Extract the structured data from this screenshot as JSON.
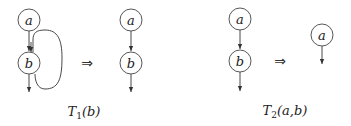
{
  "figure": {
    "transform1": {
      "label_main": "T",
      "label_sub": "1",
      "label_args": "(b)",
      "before": {
        "nodes": [
          "a",
          "b"
        ],
        "edges": [
          "a->b",
          "b->b (self loop)",
          "b->out"
        ]
      },
      "after": {
        "nodes": [
          "a",
          "b"
        ],
        "edges": [
          "a->b",
          "b->out"
        ]
      }
    },
    "transform2": {
      "label_main": "T",
      "label_sub": "2",
      "label_args": "(a,b)",
      "before": {
        "nodes": [
          "a",
          "b"
        ],
        "edges": [
          "a->b",
          "b->out"
        ]
      },
      "after": {
        "nodes": [
          "a"
        ],
        "edges": [
          "a->out"
        ]
      }
    },
    "implies_symbol": "⇒",
    "nodes": {
      "t1_before_a": "a",
      "t1_before_b": "b",
      "t1_after_a": "a",
      "t1_after_b": "b",
      "t2_before_a": "a",
      "t2_before_b": "b",
      "t2_after_a": "a"
    }
  }
}
